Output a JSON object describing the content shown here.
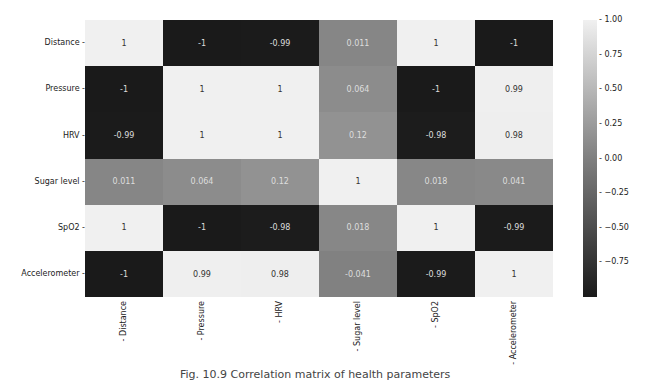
{
  "chart_data": {
    "type": "heatmap",
    "title": "",
    "xlabel": "",
    "ylabel": "",
    "rows": [
      "Distance",
      "Pressure",
      "HRV",
      "Sugar level",
      "SpO2",
      "Accelerometer"
    ],
    "columns": [
      "Distance",
      "Pressure",
      "HRV",
      "Sugar level",
      "SpO2",
      "Accelerometer"
    ],
    "values": [
      [
        1,
        -1,
        -0.99,
        0.011,
        1,
        -1
      ],
      [
        -1,
        1,
        1,
        0.064,
        -1,
        0.99
      ],
      [
        -0.99,
        1,
        1,
        0.12,
        -0.98,
        0.98
      ],
      [
        0.011,
        0.064,
        0.12,
        1,
        0.018,
        0.041
      ],
      [
        1,
        -1,
        -0.98,
        0.018,
        1,
        -0.99
      ],
      [
        -1,
        0.99,
        0.98,
        -0.041,
        -0.99,
        1
      ]
    ],
    "annotations": [
      [
        "1",
        "-1",
        "-0.99",
        "0.011",
        "1",
        "-1"
      ],
      [
        "-1",
        "1",
        "1",
        "0.064",
        "-1",
        "0.99"
      ],
      [
        "-0.99",
        "1",
        "1",
        "0.12",
        "-0.98",
        "0.98"
      ],
      [
        "0.011",
        "0.064",
        "0.12",
        "1",
        "0.018",
        "0.041"
      ],
      [
        "1",
        "-1",
        "-0.98",
        "0.018",
        "1",
        "-0.99"
      ],
      [
        "-1",
        "0.99",
        "0.98",
        "-0.041",
        "-0.99",
        "1"
      ]
    ],
    "colorbar": {
      "ticks": [
        "1.00",
        "0.75",
        "0.50",
        "0.25",
        "0.00",
        "−0.25",
        "−0.50",
        "−0.75"
      ],
      "range": [
        -1,
        1
      ],
      "colormap": "grayscale",
      "low_color": "#1a1a1a",
      "high_color": "#f0f0f0"
    }
  },
  "caption": "Fig. 10.9 Correlation matrix of health parameters"
}
